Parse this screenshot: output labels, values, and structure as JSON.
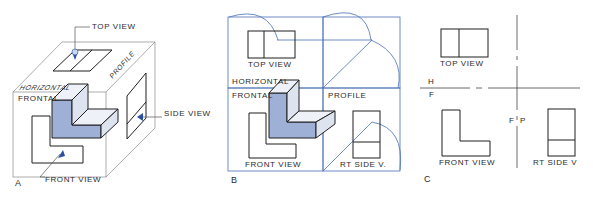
{
  "colors": {
    "ink": "#1f1f1f",
    "projection": "#4a6fb5",
    "shade_front": "#9fb0d6",
    "shade_side": "#dde3ef",
    "shade_top": "#eef1f7"
  },
  "panel_a": {
    "letter": "A",
    "labels": {
      "top_view": "TOP VIEW",
      "side_view": "SIDE VIEW",
      "front_view": "FRONT VIEW",
      "horizontal": "HORIZONTAL",
      "frontal": "FRONTAL",
      "profile": "PROFILE"
    },
    "icons": [
      "eye-arrow-top",
      "eye-arrow-side",
      "eye-arrow-front"
    ]
  },
  "panel_b": {
    "letter": "B",
    "labels": {
      "top_view": "TOP VIEW",
      "horizontal": "HORIZONTAL",
      "frontal": "FRONTAL",
      "profile": "PROFILE",
      "front_view": "FRONT VIEW",
      "rt_side_view": "RT SIDE V."
    }
  },
  "panel_c": {
    "letter": "C",
    "labels": {
      "top_view": "TOP VIEW",
      "h": "H",
      "f": "F",
      "f_p": "F",
      "p": "P",
      "front_view": "FRONT VIEW",
      "rt_side_view": "RT SIDE V"
    }
  }
}
